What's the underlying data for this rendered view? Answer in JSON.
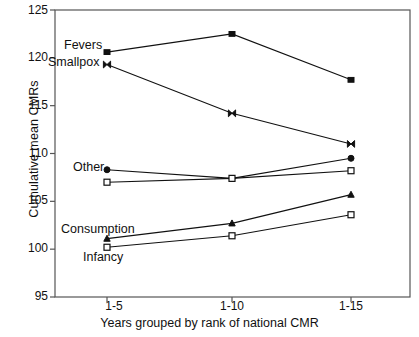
{
  "chart_data": {
    "type": "line",
    "title": "",
    "xlabel": "Years grouped by rank of national CMR",
    "ylabel": "Cumulative mean CMRs",
    "categories": [
      "1-5",
      "1-10",
      "1-15"
    ],
    "ylim": [
      95,
      125
    ],
    "yticks": [
      95,
      100,
      105,
      110,
      115,
      120,
      125
    ],
    "grid": false,
    "legend": "inline-labels",
    "series": [
      {
        "name": "Fevers",
        "marker": "square-filled",
        "values": [
          120.6,
          122.5,
          117.7
        ]
      },
      {
        "name": "Smallpox",
        "marker": "bowtie",
        "values": [
          119.3,
          114.2,
          111.0
        ]
      },
      {
        "name": "Other",
        "marker": "circle-filled",
        "values": [
          108.3,
          107.4,
          109.5
        ]
      },
      {
        "name": "Other-open",
        "marker": "square-open",
        "values": [
          107.0,
          107.4,
          108.2
        ]
      },
      {
        "name": "Consumption",
        "marker": "triangle",
        "values": [
          101.1,
          102.7,
          105.7
        ]
      },
      {
        "name": "Infancy",
        "marker": "square-open",
        "values": [
          100.2,
          101.4,
          103.6
        ]
      }
    ],
    "annotations": [
      {
        "text": "Fevers",
        "x_px": 64,
        "y_px": 45
      },
      {
        "text": "Smallpox",
        "x_px": 55,
        "y_px": 62
      },
      {
        "text": "Other",
        "x_px": 78,
        "y_px": 168
      },
      {
        "text": "Consumption",
        "x_px": 64,
        "y_px": 230
      },
      {
        "text": "Infancy",
        "x_px": 85,
        "y_px": 258
      }
    ],
    "colors": {
      "line": "#111111",
      "axis": "#555555",
      "background": "#ffffff"
    }
  }
}
